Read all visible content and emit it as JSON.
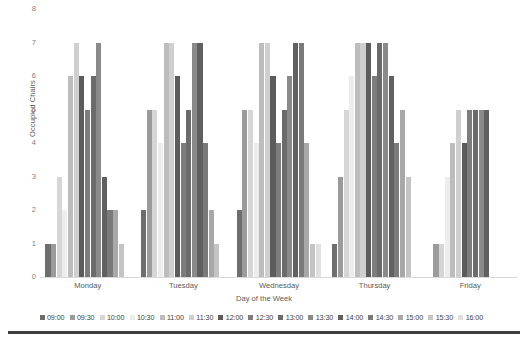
{
  "chart_data": {
    "type": "bar",
    "title": "",
    "subtitle": "",
    "xlabel": "Day of the Week",
    "ylabel": "Occupied Chairs",
    "categories": [
      "Monday",
      "Tuesday",
      "Wednesday",
      "Thursday",
      "Friday"
    ],
    "ylim": [
      0,
      8
    ],
    "yticks": [
      0,
      1,
      2,
      3,
      4,
      5,
      6,
      7,
      8
    ],
    "grid": false,
    "legend_position": "bottom",
    "series": [
      {
        "name": "09:00",
        "color": "#6e6e6e",
        "values": [
          1,
          2,
          2,
          1,
          0
        ]
      },
      {
        "name": "09:30",
        "color": "#9b9b9b",
        "values": [
          1,
          5,
          5,
          3,
          1
        ]
      },
      {
        "name": "10:00",
        "color": "#d6d6d6",
        "values": [
          3,
          5,
          5,
          5,
          1
        ]
      },
      {
        "name": "10:30",
        "color": "#ededed",
        "values": [
          2,
          4,
          4,
          6,
          3
        ]
      },
      {
        "name": "11:00",
        "color": "#bdbdbd",
        "values": [
          6,
          7,
          7,
          7,
          4
        ]
      },
      {
        "name": "11:30",
        "color": "#cfcfcf",
        "values": [
          7,
          7,
          7,
          7,
          5
        ]
      },
      {
        "name": "12:00",
        "color": "#5c5c5c",
        "values": [
          6,
          6,
          6,
          7,
          4
        ]
      },
      {
        "name": "12:30",
        "color": "#7d7d7d",
        "values": [
          5,
          4,
          4,
          6,
          5
        ]
      },
      {
        "name": "13:00",
        "color": "#6b6b6b",
        "values": [
          6,
          5,
          5,
          7,
          5
        ]
      },
      {
        "name": "13:30",
        "color": "#8a8a8a",
        "values": [
          7,
          7,
          6,
          7,
          5
        ]
      },
      {
        "name": "14:00",
        "color": "#606060",
        "values": [
          3,
          7,
          7,
          6,
          5
        ]
      },
      {
        "name": "14:30",
        "color": "#7a7a7a",
        "values": [
          2,
          4,
          7,
          4,
          0
        ]
      },
      {
        "name": "15:00",
        "color": "#a8a8a8",
        "values": [
          2,
          2,
          4,
          5,
          0
        ]
      },
      {
        "name": "15:30",
        "color": "#c4c4c4",
        "values": [
          1,
          1,
          1,
          3,
          0
        ]
      },
      {
        "name": "16:00",
        "color": "#e0e0e0",
        "values": [
          0,
          0,
          1,
          0,
          0
        ]
      }
    ]
  },
  "axes": {
    "y_ticks": [
      "8",
      "7",
      "6",
      "5",
      "4",
      "3",
      "2",
      "1",
      "0"
    ],
    "y_title": "Occupied Chairs",
    "x_title": "Day of the Week",
    "x_labels": [
      "Monday",
      "Tuesday",
      "Wednesday",
      "Thursday",
      "Friday"
    ]
  },
  "legend": {
    "items": [
      {
        "label": "09:00",
        "color": "#6e6e6e"
      },
      {
        "label": "09:30",
        "color": "#9b9b9b"
      },
      {
        "label": "10:00",
        "color": "#d6d6d6"
      },
      {
        "label": "10:30",
        "color": "#ededed"
      },
      {
        "label": "11:00",
        "color": "#bdbdbd"
      },
      {
        "label": "11:30",
        "color": "#cfcfcf"
      },
      {
        "label": "12:00",
        "color": "#5c5c5c"
      },
      {
        "label": "12:30",
        "color": "#7d7d7d"
      },
      {
        "label": "13:00",
        "color": "#6b6b6b"
      },
      {
        "label": "13:30",
        "color": "#8a8a8a"
      },
      {
        "label": "14:00",
        "color": "#606060"
      },
      {
        "label": "14:30",
        "color": "#7a7a7a"
      },
      {
        "label": "15:00",
        "color": "#a8a8a8"
      },
      {
        "label": "15:30",
        "color": "#c4c4c4"
      },
      {
        "label": "16:00",
        "color": "#e0e0e0"
      }
    ]
  }
}
